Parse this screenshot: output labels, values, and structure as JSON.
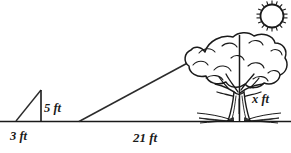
{
  "diagram": {
    "background_color": "#ffffff",
    "ink_color": "#1a1a1a",
    "ground_line": {
      "name": "ground-line",
      "y": 121.5,
      "x_start": 0,
      "x_end": 291
    },
    "labels": {
      "stick_height": "5 ft",
      "stick_shadow": "3 ft",
      "tree_shadow": "21 ft",
      "tree_height": "x ft"
    },
    "stick": {
      "name": "stick-triangle",
      "apex_x": 41,
      "apex_y": 90,
      "base_left_x": 16,
      "base_right_x": 41,
      "base_y": 121.5,
      "height_ft": 5,
      "shadow_ft": 3
    },
    "tree": {
      "name": "tree",
      "trunk_x": 239,
      "top_y": 35,
      "base_y": 121.5,
      "canopy_left_x": 185,
      "canopy_right_x": 286,
      "canopy_top_y": 35,
      "canopy_bottom_y": 95,
      "height_ft": "x",
      "shadow_ft": 21
    },
    "sun_ray": {
      "name": "sun-ray-hypotenuse",
      "from_x": 79,
      "from_y": 121.5,
      "to_x": 239,
      "to_y": 35
    },
    "sun": {
      "name": "sun",
      "center_x": 272,
      "center_y": 16,
      "radius": 12,
      "ray_count": 18,
      "ray_length": 4
    }
  }
}
